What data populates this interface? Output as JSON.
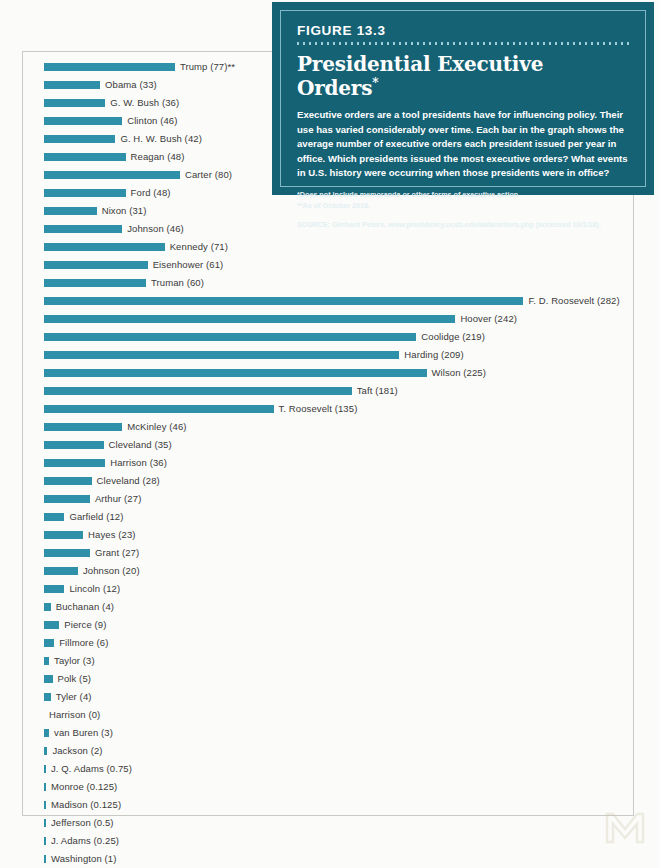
{
  "figure": {
    "number": "FIGURE 13.3",
    "title": "Presidential Executive Orders",
    "title_asterisk": "*",
    "description": "Executive orders are a tool presidents have for influencing policy. Their use has varied considerably over time. Each bar in the graph shows the average number of executive orders each president issued per year in office. Which presidents issued the most executive orders? What events in U.S. history were occurring when those presidents were in office?",
    "footnote_1": "*Does not include memoranda or other forms of executive action",
    "footnote_2": "**As of October 2018.",
    "source": "SOURCE: Gerhard Peters, www.presidency.ucsb.edu/data/orders.php (accessed 10/1/18)."
  },
  "colors": {
    "bar": "#2f90a9",
    "box_background": "#166275",
    "box_border": "#7fb9c6",
    "page_background": "#fbfbf9",
    "label_text": "#3a3a3a"
  },
  "chart_data": {
    "type": "bar",
    "orientation": "horizontal",
    "title": "Presidential Executive Orders",
    "xlabel": "Average number of executive orders issued per year in office",
    "ylabel": "",
    "xlim": [
      0,
      290
    ],
    "grid": false,
    "legend": null,
    "px_per_unit": 1.7,
    "categories": [
      "Trump",
      "Obama",
      "G. W. Bush",
      "Clinton",
      "G. H. W. Bush",
      "Reagan",
      "Carter",
      "Ford",
      "Nixon",
      "Johnson",
      "Kennedy",
      "Eisenhower",
      "Truman",
      "F. D. Roosevelt",
      "Hoover",
      "Coolidge",
      "Harding",
      "Wilson",
      "Taft",
      "T. Roosevelt",
      "McKinley",
      "Cleveland",
      "Harrison",
      "Cleveland",
      "Arthur",
      "Garfield",
      "Hayes",
      "Grant",
      "Johnson",
      "Lincoln",
      "Buchanan",
      "Pierce",
      "Fillmore",
      "Taylor",
      "Polk",
      "Tyler",
      "Harrison",
      "van Buren",
      "Jackson",
      "J. Q. Adams",
      "Monroe",
      "Madison",
      "Jefferson",
      "J. Adams",
      "Washington"
    ],
    "values": [
      77,
      33,
      36,
      46,
      42,
      48,
      80,
      48,
      31,
      46,
      71,
      61,
      60,
      282,
      242,
      219,
      209,
      225,
      181,
      135,
      46,
      35,
      36,
      28,
      27,
      12,
      23,
      27,
      20,
      12,
      4,
      9,
      6,
      3,
      5,
      4,
      0,
      3,
      2,
      0.75,
      0.125,
      0.125,
      0.5,
      0.25,
      1
    ],
    "rows": [
      {
        "label": "Trump (77)**",
        "value": 77,
        "name": "Trump"
      },
      {
        "label": "Obama (33)",
        "value": 33,
        "name": "Obama"
      },
      {
        "label": "G. W. Bush (36)",
        "value": 36,
        "name": "G. W. Bush"
      },
      {
        "label": "Clinton (46)",
        "value": 46,
        "name": "Clinton"
      },
      {
        "label": "G. H. W. Bush (42)",
        "value": 42,
        "name": "G. H. W. Bush"
      },
      {
        "label": "Reagan (48)",
        "value": 48,
        "name": "Reagan"
      },
      {
        "label": "Carter (80)",
        "value": 80,
        "name": "Carter"
      },
      {
        "label": "Ford (48)",
        "value": 48,
        "name": "Ford"
      },
      {
        "label": "Nixon (31)",
        "value": 31,
        "name": "Nixon"
      },
      {
        "label": "Johnson (46)",
        "value": 46,
        "name": "Johnson"
      },
      {
        "label": "Kennedy (71)",
        "value": 71,
        "name": "Kennedy"
      },
      {
        "label": "Eisenhower (61)",
        "value": 61,
        "name": "Eisenhower"
      },
      {
        "label": "Truman (60)",
        "value": 60,
        "name": "Truman"
      },
      {
        "label": "F. D. Roosevelt (282)",
        "value": 282,
        "name": "F. D. Roosevelt"
      },
      {
        "label": "Hoover (242)",
        "value": 242,
        "name": "Hoover"
      },
      {
        "label": "Coolidge (219)",
        "value": 219,
        "name": "Coolidge"
      },
      {
        "label": "Harding (209)",
        "value": 209,
        "name": "Harding"
      },
      {
        "label": "Wilson (225)",
        "value": 225,
        "name": "Wilson"
      },
      {
        "label": "Taft (181)",
        "value": 181,
        "name": "Taft"
      },
      {
        "label": "T. Roosevelt (135)",
        "value": 135,
        "name": "T. Roosevelt"
      },
      {
        "label": "McKinley (46)",
        "value": 46,
        "name": "McKinley"
      },
      {
        "label": "Cleveland (35)",
        "value": 35,
        "name": "Cleveland"
      },
      {
        "label": "Harrison (36)",
        "value": 36,
        "name": "Harrison"
      },
      {
        "label": "Cleveland (28)",
        "value": 28,
        "name": "Cleveland"
      },
      {
        "label": "Arthur (27)",
        "value": 27,
        "name": "Arthur"
      },
      {
        "label": "Garfield (12)",
        "value": 12,
        "name": "Garfield"
      },
      {
        "label": "Hayes (23)",
        "value": 23,
        "name": "Hayes"
      },
      {
        "label": "Grant (27)",
        "value": 27,
        "name": "Grant"
      },
      {
        "label": "Johnson (20)",
        "value": 20,
        "name": "Johnson"
      },
      {
        "label": "Lincoln (12)",
        "value": 12,
        "name": "Lincoln"
      },
      {
        "label": "Buchanan (4)",
        "value": 4,
        "name": "Buchanan"
      },
      {
        "label": "Pierce (9)",
        "value": 9,
        "name": "Pierce"
      },
      {
        "label": "Fillmore (6)",
        "value": 6,
        "name": "Fillmore"
      },
      {
        "label": "Taylor (3)",
        "value": 3,
        "name": "Taylor"
      },
      {
        "label": "Polk (5)",
        "value": 5,
        "name": "Polk"
      },
      {
        "label": "Tyler (4)",
        "value": 4,
        "name": "Tyler"
      },
      {
        "label": "Harrison (0)",
        "value": 0,
        "name": "Harrison"
      },
      {
        "label": "van Buren (3)",
        "value": 3,
        "name": "van Buren"
      },
      {
        "label": "Jackson (2)",
        "value": 2,
        "name": "Jackson"
      },
      {
        "label": "J. Q. Adams (0.75)",
        "value": 0.75,
        "name": "J. Q. Adams"
      },
      {
        "label": "Monroe (0.125)",
        "value": 0.125,
        "name": "Monroe"
      },
      {
        "label": "Madison (0.125)",
        "value": 0.125,
        "name": "Madison"
      },
      {
        "label": "Jefferson (0.5)",
        "value": 0.5,
        "name": "Jefferson"
      },
      {
        "label": "J. Adams (0.25)",
        "value": 0.25,
        "name": "J. Adams"
      },
      {
        "label": "Washington (1)",
        "value": 1,
        "name": "Washington"
      }
    ]
  }
}
